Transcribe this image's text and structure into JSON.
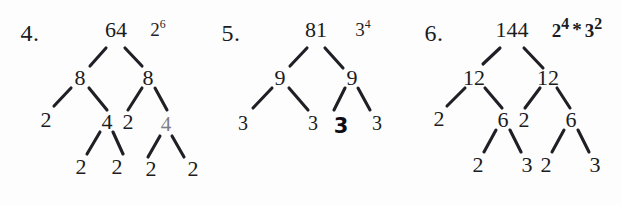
{
  "page": {
    "kind": "worksheet-factor-trees",
    "background_color": "#fdfdfd",
    "ink_color": "#1b1b20"
  },
  "problems": [
    {
      "number_label": "4.",
      "root_value": "64",
      "answer": "2⁶",
      "answer_base": "2",
      "answer_exponent": "6",
      "nodes": [
        {
          "name": "root",
          "text": "64"
        },
        {
          "name": "level1-left",
          "text": "8"
        },
        {
          "name": "level1-right",
          "text": "8"
        },
        {
          "name": "level2-a",
          "text": "2"
        },
        {
          "name": "level2-b",
          "text": "4"
        },
        {
          "name": "level2-c",
          "text": "2"
        },
        {
          "name": "level2-d",
          "text": "4"
        },
        {
          "name": "level3-a",
          "text": "2"
        },
        {
          "name": "level3-b",
          "text": "2"
        },
        {
          "name": "level3-c",
          "text": "2"
        },
        {
          "name": "level3-d",
          "text": "2"
        }
      ]
    },
    {
      "number_label": "5.",
      "root_value": "81",
      "answer": "3⁴",
      "answer_base": "3",
      "answer_exponent": "4",
      "nodes": [
        {
          "name": "root",
          "text": "81"
        },
        {
          "name": "level1-left",
          "text": "9"
        },
        {
          "name": "level1-right",
          "text": "9"
        },
        {
          "name": "leaf-a",
          "text": "3"
        },
        {
          "name": "leaf-b",
          "text": "3"
        },
        {
          "name": "leaf-c",
          "text": "3"
        },
        {
          "name": "leaf-d",
          "text": "3"
        }
      ]
    },
    {
      "number_label": "6.",
      "root_value": "144",
      "answer": "2⁴ * 3²",
      "answer_parts": [
        {
          "base": "2",
          "exponent": "4"
        },
        {
          "operator": "*"
        },
        {
          "base": "3",
          "exponent": "2"
        }
      ],
      "nodes": [
        {
          "name": "root",
          "text": "144"
        },
        {
          "name": "level1-left",
          "text": "12"
        },
        {
          "name": "level1-right",
          "text": "12"
        },
        {
          "name": "level2-a",
          "text": "2"
        },
        {
          "name": "level2-b",
          "text": "6"
        },
        {
          "name": "level2-c",
          "text": "2"
        },
        {
          "name": "level2-d",
          "text": "6"
        },
        {
          "name": "level3-a",
          "text": "2"
        },
        {
          "name": "level3-b",
          "text": "3"
        },
        {
          "name": "level3-c",
          "text": "2"
        },
        {
          "name": "level3-d",
          "text": "3"
        }
      ]
    }
  ]
}
